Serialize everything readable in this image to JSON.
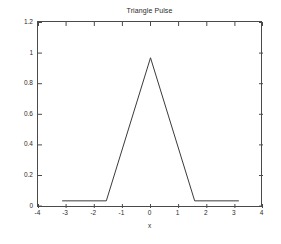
{
  "figure": {
    "background_color": "#ffffff",
    "axes_color": "#4a4a4a",
    "text_color": "#2b2b2b",
    "line_color": "#3a3a3a"
  },
  "chart_data": {
    "type": "line",
    "title": "Triangle Pulse",
    "xlabel": "x",
    "ylabel": "",
    "xlim": [
      -4,
      4
    ],
    "ylim": [
      -0.05,
      1.25
    ],
    "grid": false,
    "legend": null,
    "xticks": [
      -4,
      -3,
      -2,
      -1,
      0,
      1,
      2,
      3,
      4
    ],
    "xtick_labels": [
      "-4",
      "-3",
      "-2",
      "-1",
      "0",
      "1",
      "2",
      "3",
      "4"
    ],
    "yticks": [
      0,
      0.2,
      0.4,
      0.6,
      0.8,
      1,
      1.2
    ],
    "ytick_labels": [
      "0",
      "0.2",
      "0.4",
      "0.6",
      "0.8",
      "1",
      "1.2"
    ],
    "series": [
      {
        "name": "triangle pulse",
        "color": "#3a3a3a",
        "linewidth": 1,
        "x": [
          -3.1416,
          -1.5708,
          0,
          1.5708,
          3.1416
        ],
        "y": [
          0,
          0,
          1,
          0,
          0
        ]
      }
    ],
    "annotations": []
  }
}
